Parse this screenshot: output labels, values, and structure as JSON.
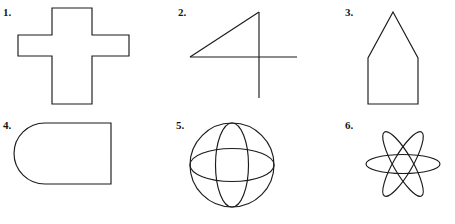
{
  "page": {
    "kind": "geometry-worksheet",
    "background_color": "#ffffff",
    "stroke_color": "#1b1b1b",
    "label_color": "#161616",
    "width": 455,
    "height": 224,
    "columns": 3,
    "rows": 2
  },
  "figures": [
    {
      "number": "1.",
      "name": "cross",
      "description": "Greek cross outline, plus-sign shape"
    },
    {
      "number": "2.",
      "name": "numeral-four",
      "description": "Open figure resembling the numeral four, made of a vertical line, a horizontal line and a diagonal line"
    },
    {
      "number": "3.",
      "name": "house-pentagon",
      "description": "Pentagon shaped like a house with a pointed roof"
    },
    {
      "number": "4.",
      "name": "rounded-d-shape",
      "description": "Shape with a semicircular left end and a flat vertical right side"
    },
    {
      "number": "5.",
      "name": "sphere-globe",
      "description": "Circle with one vertical and one horizontal ellipse forming a sphere"
    },
    {
      "number": "6.",
      "name": "six-petal-rosette",
      "description": "Flower rosette of three overlapping narrow ellipses rotated sixty degrees apart"
    }
  ]
}
